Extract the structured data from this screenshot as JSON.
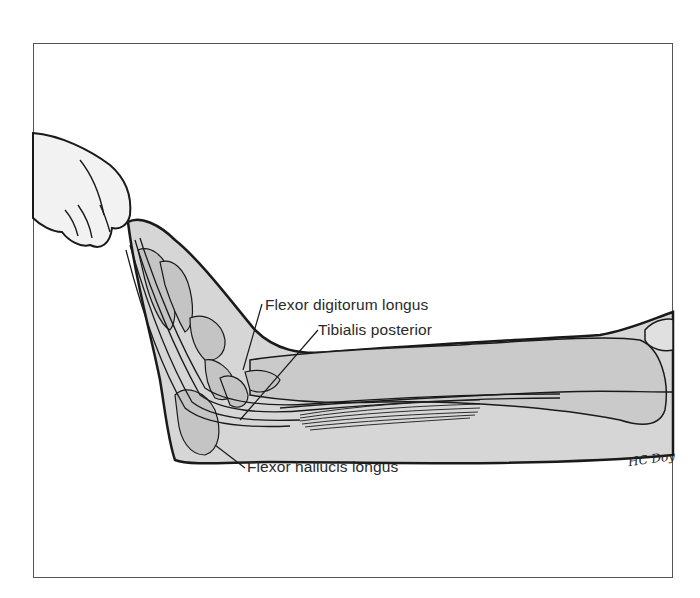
{
  "figure": {
    "labels": [
      {
        "id": "fdl",
        "text": "Flexor digitorum longus"
      },
      {
        "id": "tp",
        "text": "Tibialis posterior"
      },
      {
        "id": "fhl",
        "text": "Flexor hallucis longus"
      }
    ],
    "signature": "HC Doy",
    "colors": {
      "outline": "#1a1a1a",
      "fill_tissue": "#d6d6d6",
      "fill_bone": "#c4c4c4",
      "fill_skin_hand": "#f2f2f2",
      "frame": "#555555",
      "label_text": "#2a2a2a"
    }
  }
}
